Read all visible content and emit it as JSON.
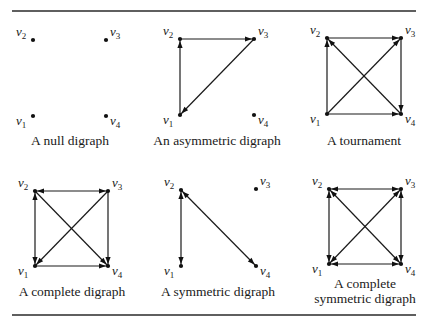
{
  "figure": {
    "rules": [
      {
        "name": "top-rule",
        "x1": 12,
        "x2": 416,
        "y": 11
      },
      {
        "name": "bottom-rule",
        "x1": 12,
        "x2": 416,
        "y": 315
      }
    ],
    "digraphs": [
      {
        "id": "null-digraph",
        "caption": [
          "A null digraph"
        ],
        "caption_pos": {
          "x": 70,
          "y": 145
        },
        "nodes": {
          "v1": [
            33,
            116
          ],
          "v2": [
            33,
            40
          ],
          "v3": [
            106,
            40
          ],
          "v4": [
            106,
            116
          ]
        },
        "edges": []
      },
      {
        "id": "asymmetric-digraph",
        "caption": [
          "An asymmetric digraph"
        ],
        "caption_pos": {
          "x": 217,
          "y": 145
        },
        "nodes": {
          "v1": [
            180,
            115
          ],
          "v2": [
            180,
            39
          ],
          "v3": [
            254,
            39
          ],
          "v4": [
            254,
            115
          ]
        },
        "edges": [
          {
            "from": "v1",
            "to": "v2",
            "both": false
          },
          {
            "from": "v2",
            "to": "v3",
            "both": false
          },
          {
            "from": "v3",
            "to": "v1",
            "both": false
          }
        ]
      },
      {
        "id": "tournament",
        "caption": [
          "A tournament"
        ],
        "caption_pos": {
          "x": 364,
          "y": 145
        },
        "nodes": {
          "v1": [
            327,
            114
          ],
          "v2": [
            327,
            38
          ],
          "v3": [
            401,
            38
          ],
          "v4": [
            401,
            114
          ]
        },
        "edges": [
          {
            "from": "v1",
            "to": "v2",
            "both": false
          },
          {
            "from": "v2",
            "to": "v3",
            "both": false
          },
          {
            "from": "v3",
            "to": "v4",
            "both": false
          },
          {
            "from": "v1",
            "to": "v4",
            "both": false
          },
          {
            "from": "v1",
            "to": "v3",
            "both": false
          },
          {
            "from": "v4",
            "to": "v2",
            "both": false
          }
        ]
      },
      {
        "id": "complete-digraph",
        "caption": [
          "A complete digraph"
        ],
        "caption_pos": {
          "x": 72,
          "y": 296
        },
        "nodes": {
          "v1": [
            35,
            266
          ],
          "v2": [
            35,
            191
          ],
          "v3": [
            108,
            191
          ],
          "v4": [
            108,
            266
          ]
        },
        "edges": [
          {
            "from": "v1",
            "to": "v2",
            "both": true
          },
          {
            "from": "v2",
            "to": "v3",
            "both": true
          },
          {
            "from": "v3",
            "to": "v4",
            "both": false
          },
          {
            "from": "v1",
            "to": "v4",
            "both": false
          },
          {
            "from": "v2",
            "to": "v4",
            "both": false
          },
          {
            "from": "v3",
            "to": "v1",
            "both": false
          }
        ]
      },
      {
        "id": "symmetric-digraph",
        "caption": [
          "A symmetric digraph"
        ],
        "caption_pos": {
          "x": 218,
          "y": 296
        },
        "nodes": {
          "v1": [
            181,
            266
          ],
          "v2": [
            181,
            190
          ],
          "v3": [
            256,
            189
          ],
          "v4": [
            256,
            266
          ]
        },
        "edges": [
          {
            "from": "v1",
            "to": "v2",
            "both": true
          },
          {
            "from": "v2",
            "to": "v4",
            "both": true
          }
        ]
      },
      {
        "id": "complete-symmetric-digraph",
        "caption": [
          "A complete",
          "symmetric digraph"
        ],
        "caption_pos": {
          "x": 365,
          "y": 288
        },
        "nodes": {
          "v1": [
            329,
            264
          ],
          "v2": [
            329,
            189
          ],
          "v3": [
            401,
            189
          ],
          "v4": [
            401,
            264
          ]
        },
        "edges": [
          {
            "from": "v1",
            "to": "v2",
            "both": true
          },
          {
            "from": "v2",
            "to": "v3",
            "both": true
          },
          {
            "from": "v3",
            "to": "v4",
            "both": true
          },
          {
            "from": "v1",
            "to": "v4",
            "both": true
          },
          {
            "from": "v1",
            "to": "v3",
            "both": true
          },
          {
            "from": "v2",
            "to": "v4",
            "both": true
          }
        ]
      }
    ],
    "vertex_labels": {
      "v1": {
        "base": "v",
        "sub": "1",
        "dx": -17,
        "dy": 9
      },
      "v2": {
        "base": "v",
        "sub": "2",
        "dx": -17,
        "dy": -4
      },
      "v3": {
        "base": "v",
        "sub": "3",
        "dx": 4,
        "dy": -4
      },
      "v4": {
        "base": "v",
        "sub": "4",
        "dx": 4,
        "dy": 9
      }
    }
  }
}
